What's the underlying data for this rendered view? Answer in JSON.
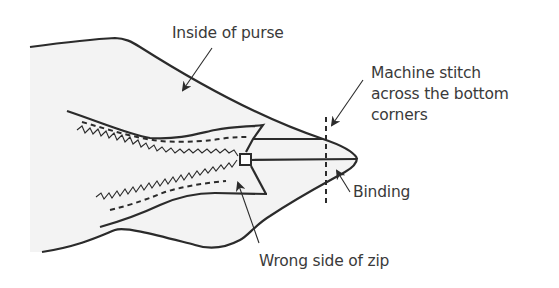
{
  "diagram": {
    "colors": {
      "background": "#ffffff",
      "fabric_fill": "#f3f3f3",
      "outline": "#2b2b2b",
      "text": "#3a3a3a"
    },
    "labels": {
      "inside_of_purse": "Inside of purse",
      "machine_stitch_line1": "Machine stitch",
      "machine_stitch_line2": "across the bottom",
      "machine_stitch_line3": "corners",
      "binding": "Binding",
      "wrong_side_of_zip": "Wrong side of zip"
    },
    "elements": [
      "purse-fabric",
      "zip-tape-upper",
      "zip-tape-lower",
      "zip-teeth",
      "zip-stitching",
      "zip-stop",
      "binding-tab",
      "stitch-line"
    ]
  }
}
